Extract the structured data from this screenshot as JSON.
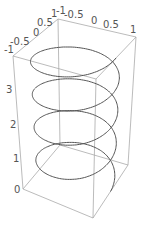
{
  "chart_data": {
    "type": "line",
    "subtype": "3d-parametric",
    "title": "",
    "x_ticks": [
      "-1",
      "-0.5",
      "0",
      "0.5",
      "1"
    ],
    "y_ticks": [
      "-1",
      "-0.5",
      "0",
      "0.5",
      "1"
    ],
    "z_ticks": [
      "0",
      "1",
      "2",
      "3"
    ],
    "xlim": [
      -1,
      1
    ],
    "ylim": [
      -1,
      1
    ],
    "zlim": [
      0,
      4
    ],
    "turns": 4,
    "series": [
      {
        "name": "helix",
        "color": "#555555"
      }
    ],
    "box_color": "#aaaaaa"
  },
  "labels": {
    "front_axis": [
      {
        "text": "-1",
        "x": 4,
        "y": 53
      },
      {
        "text": "-0.5",
        "x": 10,
        "y": 45
      },
      {
        "text": "0",
        "x": 33,
        "y": 36
      },
      {
        "text": "0.5",
        "x": 37,
        "y": 26
      },
      {
        "text": "1",
        "x": 51,
        "y": 17
      }
    ],
    "top_axis": [
      {
        "text": "-1",
        "x": 56,
        "y": 14
      },
      {
        "text": "-0.5",
        "x": 64,
        "y": 18
      },
      {
        "text": "0",
        "x": 91,
        "y": 24
      },
      {
        "text": "0.5",
        "x": 103,
        "y": 28
      },
      {
        "text": "1",
        "x": 130,
        "y": 33
      }
    ],
    "z_axis": [
      {
        "text": "3",
        "x": 6,
        "y": 93
      },
      {
        "text": "2",
        "x": 10,
        "y": 128
      },
      {
        "text": "1",
        "x": 13,
        "y": 162
      },
      {
        "text": "0",
        "x": 14,
        "y": 193
      }
    ]
  }
}
